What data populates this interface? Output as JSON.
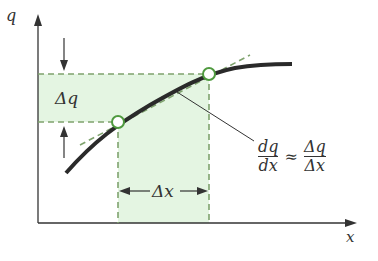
{
  "diagram": {
    "axis_labels": {
      "y": "q",
      "x": "x"
    },
    "delta_q_label": "Δq",
    "delta_x_label": "Δx",
    "formula": {
      "lhs_num": "dq",
      "lhs_den": "dx",
      "approx": "≈",
      "rhs_num": "Δq",
      "rhs_den": "Δx"
    },
    "colors": {
      "fill": "#e4f5e2",
      "dash": "#7fa36e",
      "curve": "#2a2a2a",
      "circle": "#4f9a3f"
    }
  }
}
